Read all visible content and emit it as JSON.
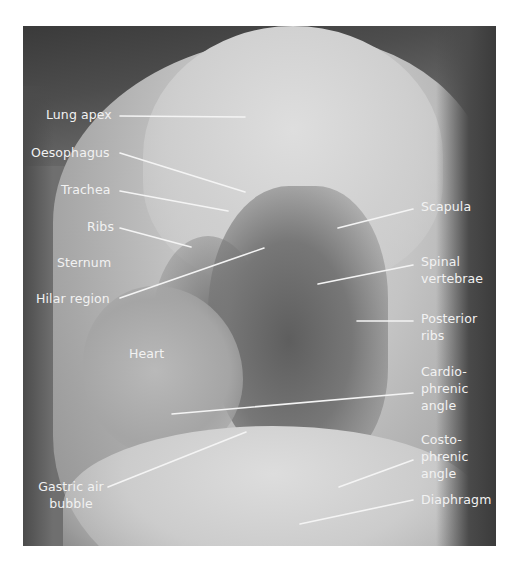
{
  "figure": {
    "labels": {
      "lung_apex": "Lung apex",
      "oesophagus": "Oesophagus",
      "trachea": "Trachea",
      "ribs": "Ribs",
      "sternum": "Sternum",
      "hilar_region": "Hilar region",
      "heart": "Heart",
      "gastric_air_bubble_1": "Gastric air",
      "gastric_air_bubble_2": "bubble",
      "scapula": "Scapula",
      "spinal_vertebrae_1": "Spinal",
      "spinal_vertebrae_2": "vertebrae",
      "posterior_ribs_1": "Posterior",
      "posterior_ribs_2": "ribs",
      "cardiophrenic_1": "Cardio-",
      "cardiophrenic_2": "phrenic",
      "cardiophrenic_3": "angle",
      "costophrenic_1": "Costo-",
      "costophrenic_2": "phrenic",
      "costophrenic_3": "angle",
      "diaphragm": "Diaphragm"
    },
    "colors": {
      "label_text": "#f2f2f2",
      "leader_line": "#f4f4f4",
      "background": "#ffffff"
    }
  }
}
